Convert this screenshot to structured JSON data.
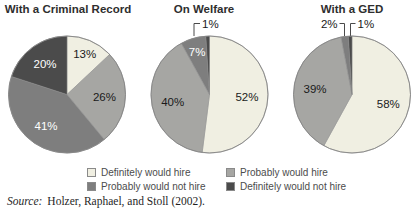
{
  "colors": {
    "definitely_would_hire": "#f0efe2",
    "probably_would_hire": "#a6a6a3",
    "probably_would_not_hire": "#7e7e7e",
    "definitely_would_not_hire": "#4b4b4b",
    "outline": "#858585",
    "label_dark": "#1a1a1a",
    "label_light": "#ffffff"
  },
  "chart_data": [
    {
      "type": "pie",
      "title": "With a Criminal Record",
      "slices": [
        {
          "category": "Definitely would hire",
          "value": 13,
          "label": "13%"
        },
        {
          "category": "Probably would hire",
          "value": 26,
          "label": "26%"
        },
        {
          "category": "Probably would not hire",
          "value": 41,
          "label": "41%"
        },
        {
          "category": "Definitely would not hire",
          "value": 20,
          "label": "20%"
        }
      ]
    },
    {
      "type": "pie",
      "title": "On Welfare",
      "slices": [
        {
          "category": "Definitely would hire",
          "value": 52,
          "label": "52%"
        },
        {
          "category": "Probably would hire",
          "value": 40,
          "label": "40%"
        },
        {
          "category": "Probably would not hire",
          "value": 7,
          "label": "7%"
        },
        {
          "category": "Definitely would not hire",
          "value": 1,
          "label": "1%"
        }
      ]
    },
    {
      "type": "pie",
      "title": "With a GED",
      "slices": [
        {
          "category": "Definitely would hire",
          "value": 58,
          "label": "58%"
        },
        {
          "category": "Probably would hire",
          "value": 39,
          "label": "39%"
        },
        {
          "category": "Probably would not hire",
          "value": 2,
          "label": "2%"
        },
        {
          "category": "Definitely would not hire",
          "value": 1,
          "label": "1%"
        }
      ]
    }
  ],
  "legend": {
    "items": [
      {
        "label": "Definitely would hire",
        "color_key": "definitely_would_hire"
      },
      {
        "label": "Probably would hire",
        "color_key": "probably_would_hire"
      },
      {
        "label": "Probably would not hire",
        "color_key": "probably_would_not_hire"
      },
      {
        "label": "Definitely would not hire",
        "color_key": "definitely_would_not_hire"
      }
    ]
  },
  "source": {
    "prefix": "Source:",
    "citation": "Holzer, Raphael, and Stoll (2002)."
  }
}
